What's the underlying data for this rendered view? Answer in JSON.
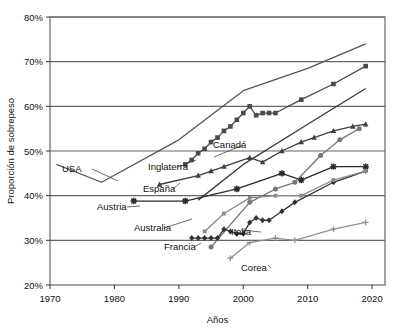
{
  "chart_data": {
    "type": "line",
    "title": "",
    "xlabel": "Años",
    "ylabel": "Proporción de sobrepeso",
    "xlim": [
      1970,
      2022
    ],
    "ylim": [
      20,
      80
    ],
    "grid": true,
    "legend_position": "inline-labels",
    "xticks": [
      "1970",
      "1980",
      "1990",
      "2000",
      "2010",
      "2020"
    ],
    "xtick_values": [
      1970,
      1980,
      1990,
      2000,
      2010,
      2020
    ],
    "yticks": [
      "20%",
      "30%",
      "40%",
      "50%",
      "60%",
      "70%",
      "80%"
    ],
    "ytick_values": [
      20,
      30,
      40,
      50,
      60,
      70,
      80
    ],
    "series": [
      {
        "name": "USA",
        "label": "USA",
        "color": "#555555",
        "marker": "none",
        "x": [
          1971,
          1978,
          1990,
          2000,
          2010,
          2019
        ],
        "values": [
          47.0,
          43.0,
          52.5,
          63.5,
          68.5,
          74.0
        ]
      },
      {
        "name": "Canadá",
        "label": "Canadá",
        "color": "#4a4a4a",
        "marker": "square",
        "x": [
          1991,
          1992,
          1993,
          1994,
          1995,
          1996,
          1997,
          1998,
          1999,
          2000,
          2001,
          2002,
          2003,
          2004,
          2005,
          2009,
          2014,
          2019
        ],
        "values": [
          47.0,
          48.0,
          49.5,
          50.5,
          52.0,
          53.0,
          54.5,
          55.5,
          57.0,
          58.5,
          60.0,
          58.0,
          58.5,
          58.5,
          58.5,
          61.5,
          65.0,
          69.0
        ]
      },
      {
        "name": "Inglaterra",
        "label": "Inglaterra",
        "color": "#3a3a3a",
        "marker": "none",
        "x": [
          1993,
          2000,
          2010,
          2019
        ],
        "values": [
          39.0,
          47.0,
          56.0,
          64.0
        ]
      },
      {
        "name": "España",
        "label": "España",
        "color": "#3f3f3f",
        "marker": "triangle",
        "x": [
          1987,
          1993,
          1995,
          1997,
          2001,
          2003,
          2006,
          2009,
          2011,
          2014,
          2017,
          2019
        ],
        "values": [
          42.5,
          44.5,
          45.5,
          46.5,
          48.5,
          47.5,
          50.0,
          52.0,
          53.0,
          54.5,
          55.5,
          56.0
        ]
      },
      {
        "name": "Austria",
        "label": "Austria",
        "color": "#2b2b2b",
        "marker": "star",
        "x": [
          1983,
          1991,
          1999,
          2006,
          2009,
          2014,
          2019
        ],
        "values": [
          38.8,
          38.8,
          41.5,
          45.0,
          43.5,
          46.5,
          46.5
        ]
      },
      {
        "name": "Australia",
        "label": "Australia",
        "color": "#777777",
        "marker": "circle",
        "x": [
          1995,
          2001,
          2005,
          2008,
          2012,
          2015,
          2018
        ],
        "values": [
          28.5,
          38.5,
          41.5,
          43.0,
          49.0,
          52.5,
          55.0
        ]
      },
      {
        "name": "Francia",
        "label": "Francia",
        "color": "#333333",
        "marker": "diamond",
        "x": [
          1992,
          1993,
          1994,
          1995,
          1996,
          1997,
          1998,
          1999,
          2000,
          2001,
          2002,
          2003,
          2004,
          2006,
          2008,
          2014,
          2019
        ],
        "values": [
          30.5,
          30.5,
          30.5,
          30.5,
          30.5,
          32.5,
          32.0,
          31.5,
          31.5,
          34.0,
          35.0,
          34.5,
          34.5,
          36.5,
          38.5,
          43.0,
          45.5
        ]
      },
      {
        "name": "Italia",
        "label": "Italia",
        "color": "#8a8a8a",
        "marker": "square-small",
        "x": [
          1994,
          1997,
          2001,
          2005,
          2009,
          2014,
          2019
        ],
        "values": [
          32.0,
          36.0,
          39.5,
          40.0,
          40.0,
          43.5,
          45.5
        ]
      },
      {
        "name": "Corea",
        "label": "Corea",
        "color": "#8f8f8f",
        "marker": "plus",
        "x": [
          1998,
          2001,
          2005,
          2008,
          2014,
          2019
        ],
        "values": [
          26.0,
          29.5,
          30.5,
          30.0,
          32.5,
          34.0
        ]
      }
    ],
    "annotations": [
      {
        "text": "USA",
        "x_px": 62,
        "y_px": 172,
        "leader_to_x": 118,
        "leader_to_y": 181
      },
      {
        "text": "Inglaterra",
        "x_px": 148,
        "y_px": 170,
        "leader_to_x": 196,
        "leader_to_y": 160
      },
      {
        "text": "Canadá",
        "x_px": 213,
        "y_px": 148,
        "leader_to_x": 214,
        "leader_to_y": 157
      },
      {
        "text": "España",
        "x_px": 143,
        "y_px": 192,
        "leader_to_x": 180,
        "leader_to_y": 183
      },
      {
        "text": "Austria",
        "x_px": 97,
        "y_px": 210,
        "leader_to_x": 140,
        "leader_to_y": 206
      },
      {
        "text": "Australia",
        "x_px": 134,
        "y_px": 231,
        "leader_to_x": 192,
        "leader_to_y": 219
      },
      {
        "text": "Francia",
        "x_px": 164,
        "y_px": 250,
        "leader_to_x": 201,
        "leader_to_y": 243
      },
      {
        "text": "Italia",
        "x_px": 231,
        "y_px": 235,
        "leader_to_x": 241,
        "leader_to_y": 230
      },
      {
        "text": "Corea",
        "x_px": 241,
        "y_px": 271,
        "leader_to_x": 268,
        "leader_to_y": 265
      }
    ]
  }
}
